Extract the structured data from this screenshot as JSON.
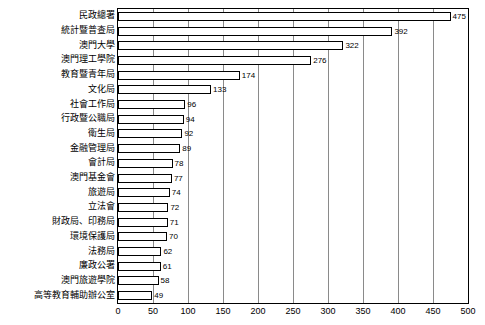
{
  "chart_data": {
    "type": "bar",
    "orientation": "horizontal",
    "title": "",
    "xlabel": "",
    "ylabel": "",
    "xlim": [
      0,
      500
    ],
    "xticks": [
      0,
      50,
      100,
      150,
      200,
      250,
      300,
      350,
      400,
      450,
      500
    ],
    "grid": true,
    "legend": "none",
    "categories": [
      "民政總署",
      "統計暨普查局",
      "澳門大學",
      "澳門理工學院",
      "教育暨青年局",
      "文化局",
      "社會工作局",
      "行政暨公職局",
      "衛生局",
      "金融管理局",
      "會計局",
      "澳門基金會",
      "旅遊局",
      "立法會",
      "財政局、印務局",
      "環境保護局",
      "法務局",
      "政府公署",
      "廉政公署",
      "澳門旅遊學院",
      "高等教育輔助辦公室"
    ],
    "values": [
      475,
      392,
      322,
      276,
      174,
      133,
      96,
      94,
      92,
      89,
      78,
      77,
      74,
      72,
      71,
      70,
      62,
      62,
      61,
      58,
      49
    ],
    "value_labels": [
      "475",
      "392",
      "322",
      "276",
      "174",
      "133",
      "96",
      "94",
      "92",
      "89",
      "78",
      "77",
      "74",
      "72",
      "71",
      "70",
      "62",
      "61",
      "58",
      "49"
    ]
  },
  "bars": [
    {
      "label": "民政總署",
      "value": 475,
      "value_label": "475"
    },
    {
      "label": "統計暨普查局",
      "value": 392,
      "value_label": "392"
    },
    {
      "label": "澳門大學",
      "value": 322,
      "value_label": "322"
    },
    {
      "label": "澳門理工學院",
      "value": 276,
      "value_label": "276"
    },
    {
      "label": "教育暨青年局",
      "value": 174,
      "value_label": "174"
    },
    {
      "label": "文化局",
      "value": 133,
      "value_label": "133"
    },
    {
      "label": "社會工作局",
      "value": 96,
      "value_label": "96"
    },
    {
      "label": "行政暨公職局",
      "value": 94,
      "value_label": "94"
    },
    {
      "label": "衛生局",
      "value": 92,
      "value_label": "92"
    },
    {
      "label": "金融管理局",
      "value": 89,
      "value_label": "89"
    },
    {
      "label": "會計局",
      "value": 78,
      "value_label": "78"
    },
    {
      "label": "澳門基金會",
      "value": 77,
      "value_label": "77"
    },
    {
      "label": "旅遊局",
      "value": 74,
      "value_label": "74"
    },
    {
      "label": "立法會",
      "value": 72,
      "value_label": "72"
    },
    {
      "label": "財政局、印務局",
      "value": 71,
      "value_label": "71"
    },
    {
      "label": "環境保護局",
      "value": 70,
      "value_label": "70"
    },
    {
      "label": "法務局",
      "value": 62,
      "value_label": "62"
    },
    {
      "label": "廉政公署",
      "value": 61,
      "value_label": "61"
    },
    {
      "label": "澳門旅遊學院",
      "value": 58,
      "value_label": "58"
    },
    {
      "label": "高等教育輔助辦公室",
      "value": 49,
      "value_label": "49"
    }
  ],
  "axis": {
    "ticks": [
      "0",
      "50",
      "100",
      "150",
      "200",
      "250",
      "300",
      "350",
      "400",
      "450",
      "500"
    ],
    "max": 500
  },
  "colors": {
    "bar_fill": "#ffffff",
    "bar_stroke": "#000000",
    "grid": "#8a8a8a",
    "frame": "#000000",
    "text": "#000000",
    "background": "#ffffff"
  }
}
